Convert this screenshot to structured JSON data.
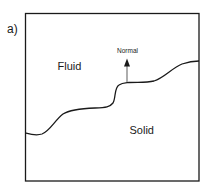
{
  "figure": {
    "panel_label": "a)",
    "regions": {
      "upper": "Fluid",
      "lower": "Solid"
    },
    "arrow": {
      "label": "Normal"
    },
    "colors": {
      "stroke": "#1a1a1a",
      "background": "#ffffff"
    }
  }
}
